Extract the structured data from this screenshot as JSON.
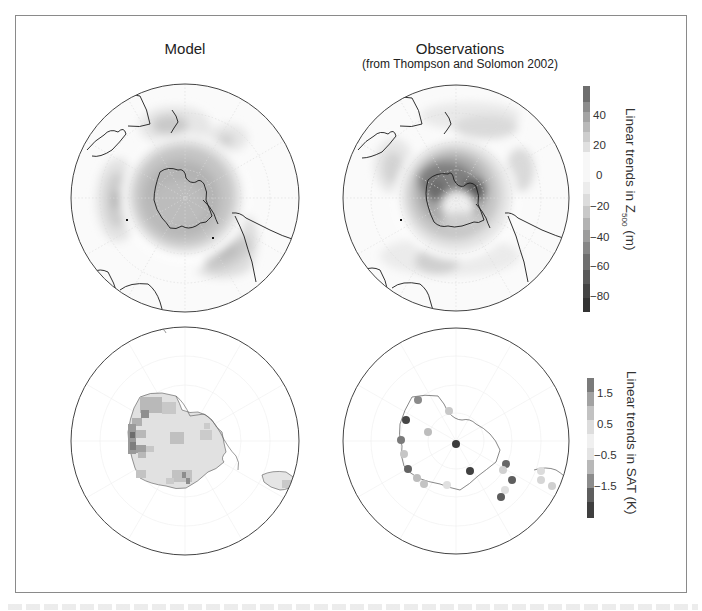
{
  "figure": {
    "panel_titles": {
      "left": "Model",
      "right": "Observations",
      "right_sub": "(from Thompson and Solomon 2002)"
    },
    "colorbars": [
      {
        "title_prefix": "Linear trends in Z",
        "title_sub": "500",
        "title_suffix": " (m)",
        "tick_labels": [
          "40",
          "20",
          "0",
          "−20",
          "−40",
          "−60",
          "−80"
        ],
        "range": [
          -90,
          60
        ]
      },
      {
        "title": "Linear trends in SAT (K)",
        "tick_labels": [
          "1.5",
          "0.5",
          "−0.5",
          "−1.5"
        ],
        "range": [
          -2,
          2
        ]
      }
    ],
    "panels": [
      {
        "id": "model-z500",
        "row": 1,
        "col": 1,
        "field": "Z500 trend",
        "projection": "south polar stereographic"
      },
      {
        "id": "obs-z500",
        "row": 1,
        "col": 2,
        "field": "Z500 trend",
        "projection": "south polar stereographic"
      },
      {
        "id": "model-sat",
        "row": 2,
        "col": 1,
        "field": "SAT trend",
        "projection": "south polar stereographic"
      },
      {
        "id": "obs-sat",
        "row": 2,
        "col": 2,
        "field": "SAT trend (station dots)",
        "projection": "south polar stereographic"
      }
    ],
    "colors": {
      "frame": "#8a8a8a",
      "coast": "#1a1a1a",
      "circle": "#444444"
    }
  }
}
